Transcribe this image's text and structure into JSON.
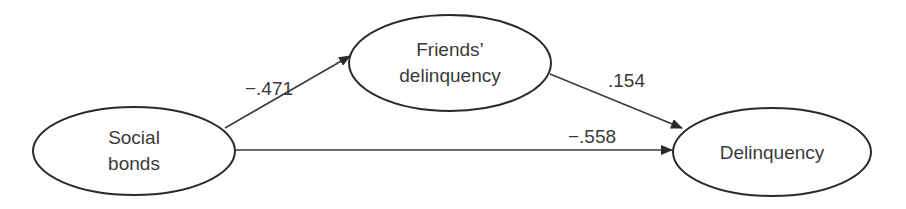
{
  "diagram": {
    "nodes": [
      {
        "id": "social_bonds",
        "lines": [
          "Social",
          "bonds"
        ]
      },
      {
        "id": "friends_delinquency",
        "lines": [
          "Friends’",
          "delinquency"
        ]
      },
      {
        "id": "delinquency",
        "lines": [
          "Delinquency"
        ]
      }
    ],
    "edges": [
      {
        "from": "social_bonds",
        "to": "friends_delinquency",
        "coefficient": "−.471"
      },
      {
        "from": "friends_delinquency",
        "to": "delinquency",
        "coefficient": ".154"
      },
      {
        "from": "social_bonds",
        "to": "delinquency",
        "coefficient": "−.558"
      }
    ],
    "colors": {
      "stroke": "#2a2a2a",
      "text": "#3a3a3a",
      "background": "#ffffff"
    }
  }
}
